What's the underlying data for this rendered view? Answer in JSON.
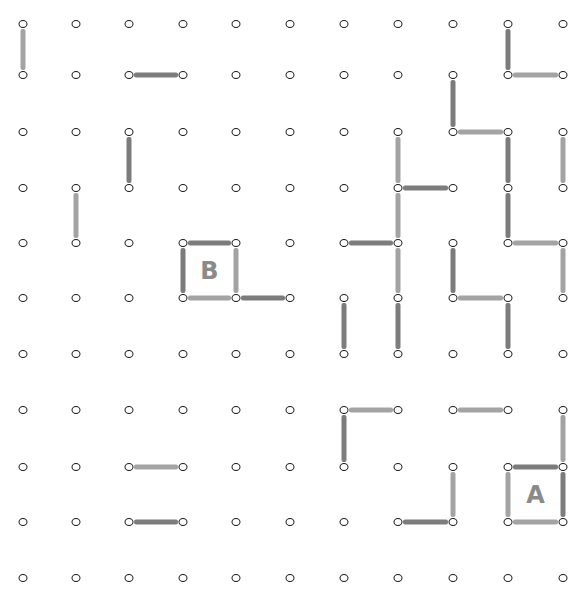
{
  "game": {
    "title": "Dots and Boxes",
    "grid": {
      "cols": 11,
      "rows": 11,
      "col_x": [
        23,
        76,
        129,
        183,
        236,
        290,
        344,
        398,
        453,
        508,
        563
      ],
      "row_y": [
        24,
        75,
        132,
        188,
        243,
        298,
        354,
        410,
        467,
        522,
        578
      ]
    },
    "colors": {
      "dot_outline": "#1a1a1a",
      "line_light": "#a3a3a3",
      "line_dark": "#7c7c7c",
      "label": "#8a8a8a",
      "background": "#ffffff"
    },
    "lines": [
      {
        "orient": "v",
        "c": 0,
        "r": 0,
        "shade": "light"
      },
      {
        "orient": "h",
        "c": 2,
        "r": 1,
        "shade": "dark"
      },
      {
        "orient": "v",
        "c": 9,
        "r": 0,
        "shade": "dark"
      },
      {
        "orient": "h",
        "c": 9,
        "r": 1,
        "shade": "light"
      },
      {
        "orient": "v",
        "c": 8,
        "r": 1,
        "shade": "dark"
      },
      {
        "orient": "h",
        "c": 8,
        "r": 2,
        "shade": "light"
      },
      {
        "orient": "v",
        "c": 2,
        "r": 2,
        "shade": "dark"
      },
      {
        "orient": "v",
        "c": 7,
        "r": 2,
        "shade": "light"
      },
      {
        "orient": "v",
        "c": 9,
        "r": 2,
        "shade": "dark"
      },
      {
        "orient": "v",
        "c": 10,
        "r": 2,
        "shade": "light"
      },
      {
        "orient": "h",
        "c": 7,
        "r": 3,
        "shade": "dark"
      },
      {
        "orient": "v",
        "c": 1,
        "r": 3,
        "shade": "light"
      },
      {
        "orient": "v",
        "c": 7,
        "r": 3,
        "shade": "light"
      },
      {
        "orient": "v",
        "c": 9,
        "r": 3,
        "shade": "dark"
      },
      {
        "orient": "h",
        "c": 6,
        "r": 4,
        "shade": "dark"
      },
      {
        "orient": "h",
        "c": 3,
        "r": 4,
        "shade": "dark"
      },
      {
        "orient": "v",
        "c": 3,
        "r": 4,
        "shade": "dark"
      },
      {
        "orient": "v",
        "c": 4,
        "r": 4,
        "shade": "light"
      },
      {
        "orient": "h",
        "c": 3,
        "r": 5,
        "shade": "light"
      },
      {
        "orient": "h",
        "c": 4,
        "r": 5,
        "shade": "dark"
      },
      {
        "orient": "v",
        "c": 7,
        "r": 4,
        "shade": "light"
      },
      {
        "orient": "v",
        "c": 8,
        "r": 4,
        "shade": "dark"
      },
      {
        "orient": "h",
        "c": 9,
        "r": 4,
        "shade": "light"
      },
      {
        "orient": "v",
        "c": 10,
        "r": 4,
        "shade": "light"
      },
      {
        "orient": "h",
        "c": 8,
        "r": 5,
        "shade": "light"
      },
      {
        "orient": "v",
        "c": 6,
        "r": 5,
        "shade": "dark"
      },
      {
        "orient": "v",
        "c": 7,
        "r": 5,
        "shade": "dark"
      },
      {
        "orient": "v",
        "c": 9,
        "r": 5,
        "shade": "dark"
      },
      {
        "orient": "h",
        "c": 6,
        "r": 7,
        "shade": "light"
      },
      {
        "orient": "h",
        "c": 8,
        "r": 7,
        "shade": "light"
      },
      {
        "orient": "v",
        "c": 6,
        "r": 7,
        "shade": "dark"
      },
      {
        "orient": "v",
        "c": 10,
        "r": 7,
        "shade": "light"
      },
      {
        "orient": "h",
        "c": 2,
        "r": 8,
        "shade": "light"
      },
      {
        "orient": "v",
        "c": 8,
        "r": 8,
        "shade": "light"
      },
      {
        "orient": "h",
        "c": 9,
        "r": 8,
        "shade": "dark"
      },
      {
        "orient": "v",
        "c": 9,
        "r": 8,
        "shade": "light"
      },
      {
        "orient": "v",
        "c": 10,
        "r": 8,
        "shade": "dark"
      },
      {
        "orient": "h",
        "c": 9,
        "r": 9,
        "shade": "light"
      },
      {
        "orient": "h",
        "c": 2,
        "r": 9,
        "shade": "dark"
      },
      {
        "orient": "h",
        "c": 7,
        "r": 9,
        "shade": "dark"
      }
    ],
    "boxes": [
      {
        "c": 3,
        "r": 4,
        "owner": "B"
      },
      {
        "c": 9,
        "r": 8,
        "owner": "A"
      }
    ]
  }
}
